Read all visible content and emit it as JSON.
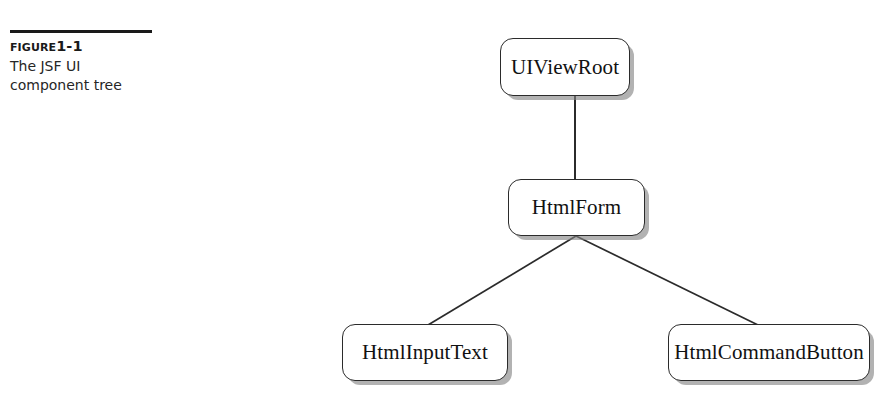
{
  "figure": {
    "label_prefix": "Figure",
    "label_number": "1-1",
    "caption": "The JSF UI component tree"
  },
  "diagram": {
    "type": "tree",
    "nodes": [
      {
        "id": "uiviewroot",
        "label": "UIViewRoot"
      },
      {
        "id": "htmlform",
        "label": "HtmlForm"
      },
      {
        "id": "htmlinputtext",
        "label": "HtmlInputText"
      },
      {
        "id": "htmlcommandbutton",
        "label": "HtmlCommandButton"
      }
    ],
    "edges": [
      {
        "from": "uiviewroot",
        "to": "htmlform"
      },
      {
        "from": "htmlform",
        "to": "htmlinputtext"
      },
      {
        "from": "htmlform",
        "to": "htmlcommandbutton"
      }
    ]
  },
  "colors": {
    "line": "#2b2b2b",
    "node_fill": "#ffffff",
    "node_border": "#2b2b2b",
    "shadow": "#8a8a8a",
    "text": "#111111",
    "rule": "#1a1a1a"
  }
}
